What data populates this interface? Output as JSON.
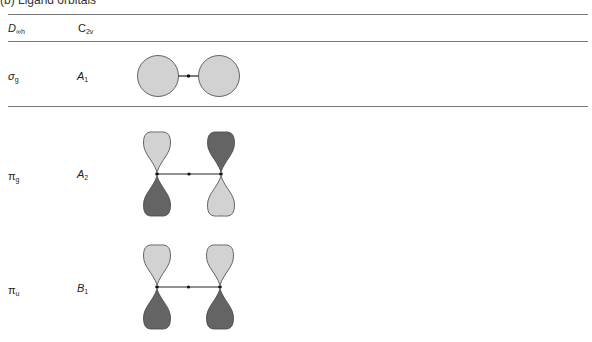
{
  "title": "(b) Ligand orbitals",
  "header": {
    "col1": {
      "main": "D",
      "sub": "∞h"
    },
    "col2": {
      "main": "C",
      "sub": "2v"
    }
  },
  "rows": [
    {
      "dinf": {
        "main": "σ",
        "sub": "g"
      },
      "c2v": {
        "main": "A",
        "sub": "1"
      },
      "orbital": "sigma-s-pair"
    },
    {
      "dinf": {
        "main": "π",
        "sub": "g"
      },
      "c2v": {
        "main": "A",
        "sub": "2"
      },
      "orbital": "pi-antisymmetric-pair"
    },
    {
      "dinf": {
        "main": "π",
        "sub": "u"
      },
      "c2v": {
        "main": "B",
        "sub": "1"
      },
      "orbital": "pi-symmetric-pair"
    }
  ],
  "colors": {
    "light_lobe": "#d2d2d2",
    "dark_lobe": "#646464",
    "outline": "#444444",
    "rule": "#777777"
  }
}
